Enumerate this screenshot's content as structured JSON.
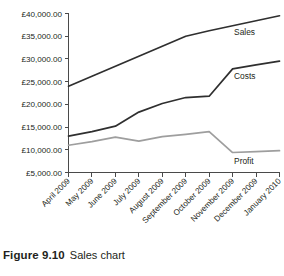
{
  "figure": {
    "caption_number": "Figure 9.10",
    "caption_text": "Sales chart"
  },
  "chart_data": {
    "type": "line",
    "title": "",
    "xlabel": "",
    "ylabel": "",
    "categories": [
      "April 2009",
      "May 2009",
      "June 2009",
      "July 2009",
      "August 2009",
      "September 2009",
      "October 2009",
      "November 2009",
      "December 2009",
      "January 2010"
    ],
    "series": [
      {
        "name": "Sales",
        "color": "#2f2f2f",
        "values": [
          24000,
          26200,
          28400,
          30600,
          32800,
          35000,
          36200,
          37300,
          38400,
          39500
        ]
      },
      {
        "name": "Costs",
        "color": "#2f2f2f",
        "values": [
          13000,
          14000,
          15200,
          18300,
          20200,
          21500,
          21800,
          27800,
          28700,
          29500
        ]
      },
      {
        "name": "Profit",
        "color": "#9e9e9e",
        "values": [
          11000,
          11800,
          12800,
          11900,
          12900,
          13400,
          14000,
          9400,
          9600,
          9800
        ]
      }
    ],
    "ylim": [
      5000,
      40000
    ],
    "ytick_values": [
      5000,
      10000,
      15000,
      20000,
      25000,
      30000,
      35000,
      40000
    ],
    "ytick_labels": [
      "£5,000.00",
      "£10,000.00",
      "£15,000.00",
      "£20,000.00",
      "£25,000.00",
      "£30,000.00",
      "£35,000.00",
      "£40,000.00"
    ],
    "grid": false,
    "legend_position": "inline-right",
    "annotations": [
      {
        "label": "Sales",
        "near_category": "December 2009"
      },
      {
        "label": "Costs",
        "near_category": "December 2009"
      },
      {
        "label": "Profit",
        "near_category": "December 2009"
      }
    ]
  }
}
